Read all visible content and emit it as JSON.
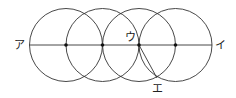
{
  "diagram": {
    "circles": [
      {
        "cx": 66,
        "cy": 45,
        "r": 36.5
      },
      {
        "cx": 102.5,
        "cy": 45,
        "r": 36.5
      },
      {
        "cx": 139,
        "cy": 45,
        "r": 36.5
      },
      {
        "cx": 175.5,
        "cy": 45,
        "r": 36.5
      }
    ],
    "baseline": {
      "x1": 29.5,
      "y1": 45,
      "x2": 212,
      "y2": 45
    },
    "segment": {
      "x1": 139,
      "y1": 45,
      "x2": 157,
      "y2": 78
    },
    "points": [
      {
        "x": 66,
        "y": 45
      },
      {
        "x": 102.5,
        "y": 45
      },
      {
        "x": 139,
        "y": 45
      },
      {
        "x": 175.5,
        "y": 45
      }
    ],
    "labels": {
      "a": "ア",
      "i": "イ",
      "u": "ウ",
      "e": "エ"
    },
    "stroke_color": "#333333"
  }
}
